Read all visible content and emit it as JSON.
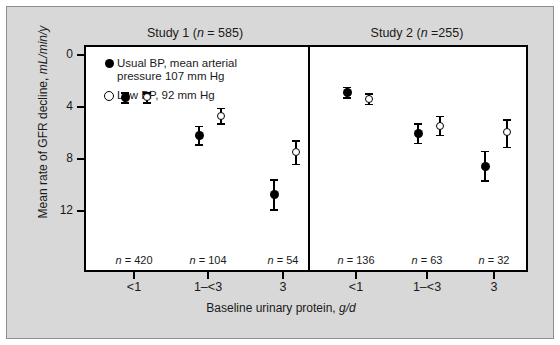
{
  "figure": {
    "background_color": "#d8d8d8",
    "plot_background_color": "#ffffff",
    "border_color": "#8e8e8e"
  },
  "chart_data": {
    "type": "scatter",
    "title": "",
    "xlabel": "Baseline urinary protein, g/d",
    "ylabel": "Mean rate of GFR decline, mL/min/y",
    "ylim": [
      12,
      -2
    ],
    "yticks": [
      0,
      4,
      8,
      12
    ],
    "ytick_labels": [
      "0",
      "4",
      "8",
      "12"
    ],
    "grid": false,
    "legend_position": "top-left",
    "y_axis_inverted": true,
    "panels": [
      {
        "title": "Study 1 (n = 585)",
        "title_prefix": "Study 1 (",
        "title_italic": "n",
        "title_suffix": " = 585)",
        "categories": [
          "<1",
          "1–<3",
          "3"
        ],
        "n_labels": [
          "n = 420",
          "n = 104",
          "n = 54"
        ],
        "n_values": [
          420,
          104,
          54
        ],
        "series": [
          {
            "name": "Usual BP, mean arterial pressure 107 mm Hg",
            "marker": "filled-circle",
            "values": [
              3.1,
              6.0,
              10.6
            ],
            "err_low": [
              2.7,
              5.3,
              9.4
            ],
            "err_high": [
              3.5,
              6.7,
              11.7
            ]
          },
          {
            "name": "Low BP, 92 mm Hg",
            "marker": "open-circle",
            "values": [
              3.1,
              4.5,
              7.3
            ],
            "err_low": [
              2.7,
              3.9,
              6.4
            ],
            "err_high": [
              3.5,
              5.1,
              8.2
            ]
          }
        ]
      },
      {
        "title": "Study 2 (n =255)",
        "title_prefix": "Study 2 (",
        "title_italic": "n",
        "title_suffix": " =255)",
        "categories": [
          "<1",
          "1–<3",
          "3"
        ],
        "n_labels": [
          "n = 136",
          "n = 63",
          "n = 32"
        ],
        "n_values": [
          136,
          63,
          32
        ],
        "series": [
          {
            "name": "Usual BP, mean arterial pressure 107 mm Hg",
            "marker": "filled-circle",
            "values": [
              2.7,
              5.9,
              8.4
            ],
            "err_low": [
              2.3,
              5.1,
              7.2
            ],
            "err_high": [
              3.1,
              6.6,
              9.5
            ]
          },
          {
            "name": "Low BP, 92 mm Hg",
            "marker": "open-circle",
            "values": [
              3.2,
              5.3,
              5.8
            ],
            "err_low": [
              2.8,
              4.5,
              4.8
            ],
            "err_high": [
              3.6,
              6.0,
              6.9
            ]
          }
        ]
      }
    ]
  },
  "legend": {
    "items": [
      {
        "marker": "filled-circle",
        "label": "Usual BP, mean arterial\npressure 107 mm Hg"
      },
      {
        "marker": "open-circle",
        "label": "Low BP, 92 mm Hg"
      }
    ]
  },
  "axes": {
    "y_label_prefix": "Mean rate of GFR decline, ",
    "y_label_italic": "mL/min/y",
    "x_label_prefix": "Baseline  urinary  protein, ",
    "x_label_italic": "g/d"
  }
}
